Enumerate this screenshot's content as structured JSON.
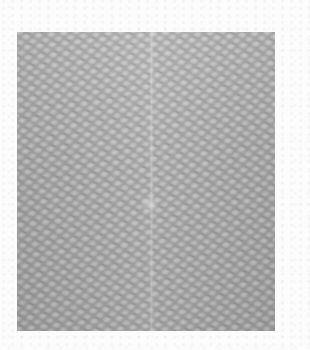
{
  "image": {
    "description": "Grayscale micrograph of a textured, woven/lattice-like surface",
    "colors": {
      "background": "#fcfcfc",
      "specimen_base": "#a9a9a9",
      "highlight": "#d2d2d2",
      "shadow": "#787878"
    },
    "specimen_region": {
      "x": 17,
      "y": 32,
      "width": 258,
      "height": 299
    },
    "features": [
      {
        "name": "lattice-pattern",
        "label": "periodic bumpy lattice texture"
      },
      {
        "name": "vertical-seam",
        "label": "faint vertical seam near center"
      },
      {
        "name": "bright-spot",
        "label": "slightly brighter patch near center"
      }
    ]
  }
}
